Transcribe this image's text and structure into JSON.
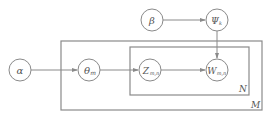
{
  "diagram": {
    "type": "plate-notation graphical model",
    "nodes": [
      {
        "id": "alpha",
        "label": "α",
        "sub": "",
        "cx": 20,
        "cy": 70
      },
      {
        "id": "theta",
        "label": "θ",
        "sub": "m",
        "cx": 89,
        "cy": 70
      },
      {
        "id": "z",
        "label": "Z",
        "sub": "m,n",
        "cx": 150,
        "cy": 70
      },
      {
        "id": "w",
        "label": "W",
        "sub": "m,n",
        "cx": 217,
        "cy": 70
      },
      {
        "id": "beta",
        "label": "β",
        "sub": "",
        "cx": 152,
        "cy": 20
      },
      {
        "id": "psi",
        "label": "Ψ",
        "sub": "k",
        "cx": 217,
        "cy": 20
      }
    ],
    "edges": [
      {
        "from": "alpha",
        "to": "theta"
      },
      {
        "from": "theta",
        "to": "z"
      },
      {
        "from": "z",
        "to": "w"
      },
      {
        "from": "beta",
        "to": "psi"
      },
      {
        "from": "psi",
        "to": "w"
      }
    ],
    "plates": [
      {
        "id": "outer",
        "label": "M"
      },
      {
        "id": "inner",
        "label": "N"
      }
    ]
  },
  "labels": {
    "alpha": "α",
    "theta": "θ",
    "theta_sub": "m",
    "z": "Z",
    "z_sub": "m,n",
    "w": "W",
    "w_sub": "m,n",
    "beta": "β",
    "psi": "Ψ",
    "psi_sub": "k",
    "plate_outer": "M",
    "plate_inner": "N"
  },
  "colors": {
    "stroke": "#8a8a8a",
    "text": "#555555",
    "background": "#ffffff"
  }
}
